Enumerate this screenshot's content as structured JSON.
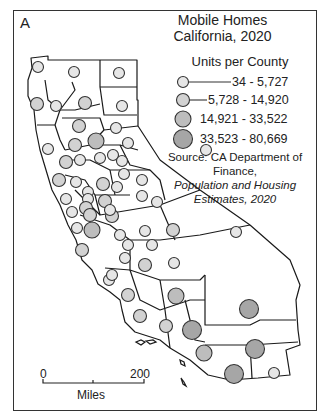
{
  "panel_letter": "A",
  "title_line1": "Mobile Homes",
  "title_line2": "California, 2020",
  "legend": {
    "title": "Units per County",
    "classes": [
      {
        "label": "34 - 5,727",
        "fill": "#e6e6e6"
      },
      {
        "label": "5,728 - 14,920",
        "fill": "#d2d2d2"
      },
      {
        "label": "14,921 - 33,522",
        "fill": "#bdbdbd"
      },
      {
        "label": "33,523 - 80,669",
        "fill": "#a6a6a6"
      }
    ]
  },
  "source": {
    "prefix": "Source: CA Department of Finance,",
    "italic_line1": "Population and Housing",
    "italic_line2": "Estimates, 2020"
  },
  "scale_bar": {
    "zero": "0",
    "max": "200",
    "unit": "Miles"
  },
  "map": {
    "region": "California counties",
    "symbol": "graduated circles (proportional by class)"
  }
}
